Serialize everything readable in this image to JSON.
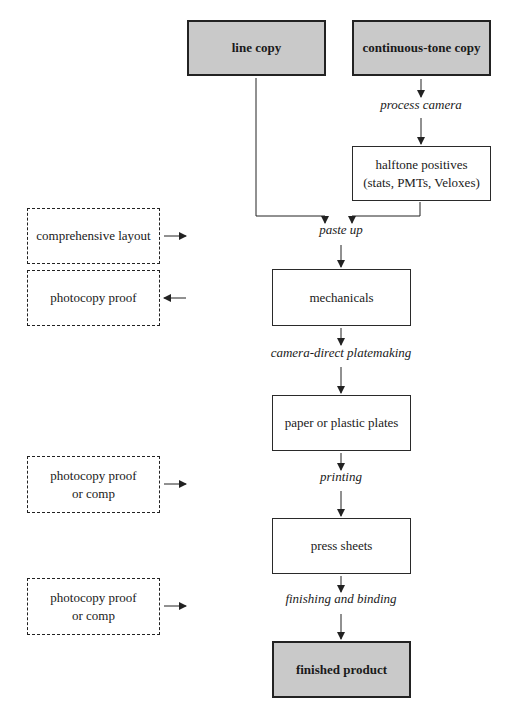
{
  "diagram": {
    "title": "",
    "colors": {
      "shaded_fill": "#c9c9c9",
      "line": "#222222",
      "background": "#ffffff"
    },
    "boxes": [
      {
        "id": "line-copy",
        "text": "line copy",
        "style": "shaded",
        "x": 187,
        "y": 20,
        "w": 139,
        "h": 56
      },
      {
        "id": "continuous-tone-copy",
        "text": "continuous-tone copy",
        "style": "shaded",
        "x": 352,
        "y": 20,
        "w": 139,
        "h": 56
      },
      {
        "id": "halftone-positives",
        "text": "halftone positives\n(stats, PMTs, Veloxes)",
        "line1": "halftone positives",
        "line2": "(stats, PMTs, Veloxes)",
        "style": "solid",
        "x": 352,
        "y": 146,
        "w": 139,
        "h": 55
      },
      {
        "id": "mechanicals",
        "text": "mechanicals",
        "style": "solid",
        "x": 272,
        "y": 269,
        "w": 139,
        "h": 57
      },
      {
        "id": "paper-or-plastic-plates",
        "text": "paper or plastic plates",
        "style": "solid",
        "x": 272,
        "y": 395,
        "w": 139,
        "h": 56
      },
      {
        "id": "press-sheets",
        "text": "press sheets",
        "style": "solid",
        "x": 272,
        "y": 518,
        "w": 139,
        "h": 56
      },
      {
        "id": "finished-product",
        "text": "finished product",
        "style": "shaded",
        "x": 272,
        "y": 641,
        "w": 139,
        "h": 57
      },
      {
        "id": "comprehensive-layout",
        "text": "comprehensive layout",
        "style": "dashed",
        "x": 27,
        "y": 208,
        "w": 133,
        "h": 56
      },
      {
        "id": "photocopy-proof",
        "text": "photocopy proof",
        "style": "dashed",
        "x": 27,
        "y": 270,
        "w": 133,
        "h": 56
      },
      {
        "id": "photocopy-proof-or-comp-1",
        "line1": "photocopy proof",
        "line2": "or comp",
        "style": "dashed",
        "x": 27,
        "y": 456,
        "w": 133,
        "h": 57
      },
      {
        "id": "photocopy-proof-or-comp-2",
        "line1": "photocopy proof",
        "line2": "or comp",
        "style": "dashed",
        "x": 27,
        "y": 578,
        "w": 133,
        "h": 57
      }
    ],
    "process_labels": [
      {
        "id": "process-camera",
        "text": "process camera",
        "x": 421,
        "y": 104
      },
      {
        "id": "paste-up",
        "text": "paste up",
        "x": 341,
        "y": 229
      },
      {
        "id": "camera-direct-platemaking",
        "text": "camera-direct platemaking",
        "x": 341,
        "y": 352
      },
      {
        "id": "printing",
        "text": "printing",
        "x": 341,
        "y": 476
      },
      {
        "id": "finishing-and-binding",
        "text": "finishing and binding",
        "x": 341,
        "y": 598
      }
    ]
  }
}
